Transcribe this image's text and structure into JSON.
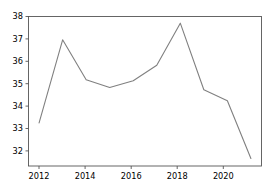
{
  "chart_data": {
    "type": "line",
    "title": "",
    "xlabel": "",
    "ylabel": "",
    "x": [
      2012,
      2013,
      2014,
      2015,
      2016,
      2017,
      2018,
      2019,
      2020,
      2021
    ],
    "values": [
      33.2,
      36.95,
      35.15,
      34.8,
      35.1,
      35.8,
      37.7,
      34.7,
      34.2,
      31.6
    ],
    "series": [
      {
        "name": "series-1",
        "values": [
          33.2,
          36.95,
          35.15,
          34.8,
          35.1,
          35.8,
          37.7,
          34.7,
          34.2,
          31.6
        ]
      }
    ],
    "xlim": [
      2011.55,
      2021.45
    ],
    "ylim": [
      31.26,
      38.0
    ],
    "xticks": [
      2012,
      2014,
      2016,
      2018,
      2020
    ],
    "yticks": [
      32,
      33,
      34,
      35,
      36,
      37,
      38
    ],
    "xticklabels": [
      "2012",
      "2014",
      "2016",
      "2018",
      "2020"
    ],
    "yticklabels": [
      "32",
      "33",
      "34",
      "35",
      "36",
      "37",
      "38"
    ],
    "grid": false,
    "legend": false,
    "line_color": "#808080",
    "spine_color": "#555555",
    "background_color": "#ffffff"
  }
}
